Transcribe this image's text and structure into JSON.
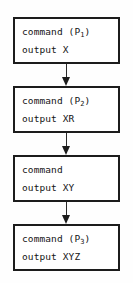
{
  "diagram": {
    "orientation": "vertical-top-to-bottom",
    "colors": {
      "background": "#fefefe",
      "box_fill": "#ffffff",
      "box_border": "#1c1c1c",
      "text": "#141414",
      "arrow": "#2a2a2a"
    },
    "connector_glyph": "downward-arrow",
    "nodes": [
      {
        "id": "node-1",
        "command_label": "command",
        "process_open": " (P",
        "process_index": "1",
        "process_close": ")",
        "output_label": "output",
        "output_value": "X"
      },
      {
        "id": "node-2",
        "command_label": "command",
        "process_open": " (P",
        "process_index": "2",
        "process_close": ")",
        "output_label": "output",
        "output_value": "XR"
      },
      {
        "id": "node-3",
        "command_label": "command",
        "process_open": "",
        "process_index": "",
        "process_close": "",
        "output_label": "output",
        "output_value": "XY"
      },
      {
        "id": "node-4",
        "command_label": "command",
        "process_open": " (P",
        "process_index": "3",
        "process_close": ")",
        "output_label": "output",
        "output_value": "XYZ"
      }
    ]
  }
}
